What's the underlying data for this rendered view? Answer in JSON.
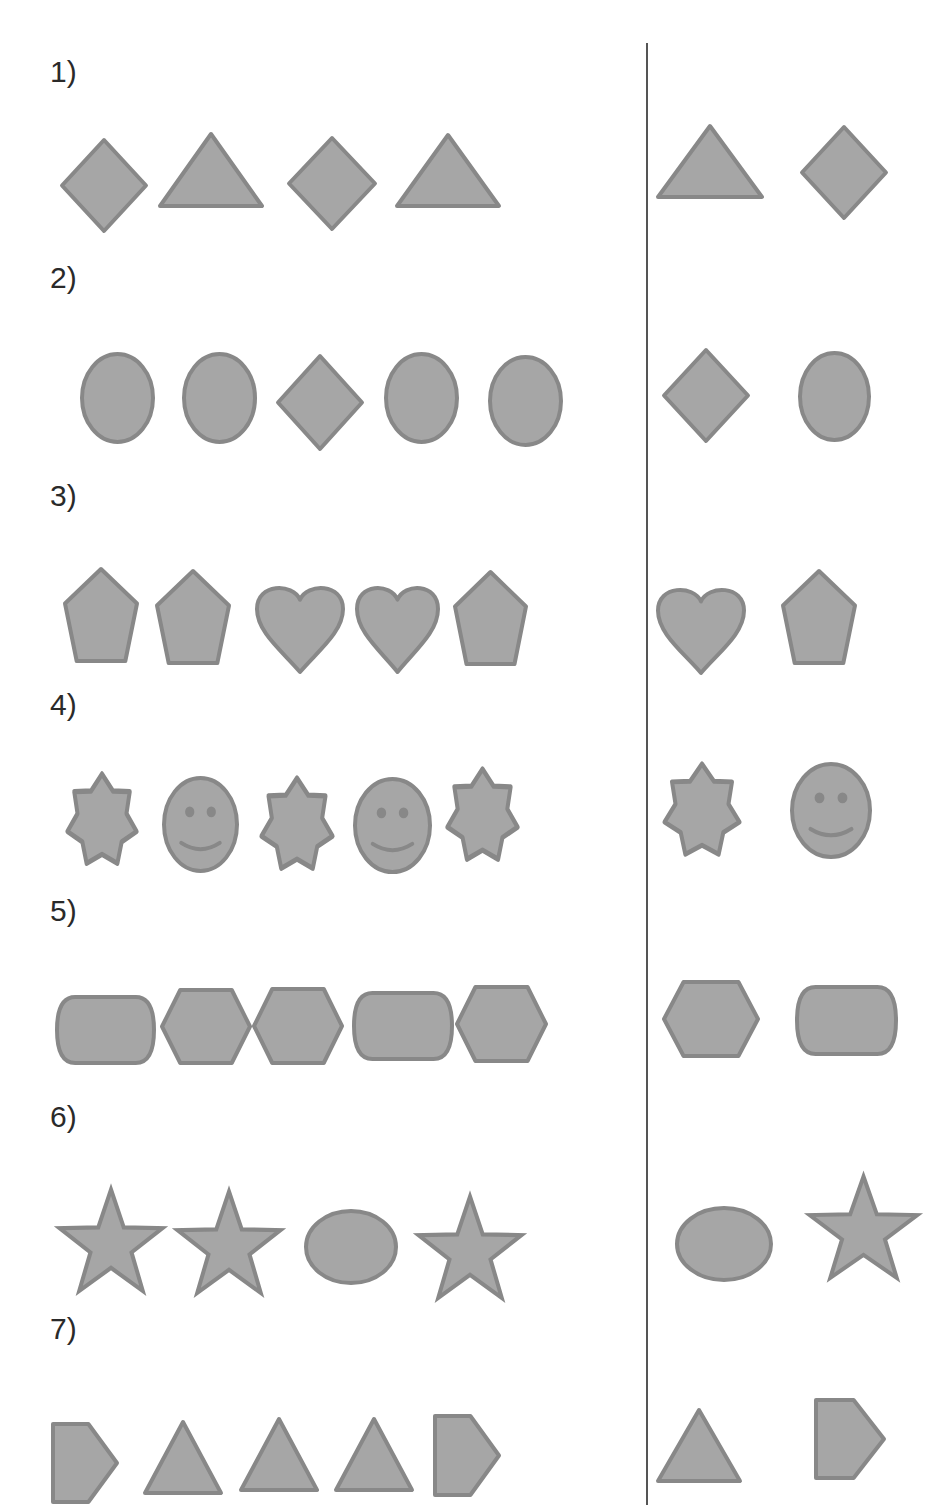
{
  "worksheet": {
    "colors": {
      "fill": "#a6a6a6",
      "stroke": "#888888",
      "text": "#2a2a2a",
      "divider": "#555555"
    },
    "problems": [
      {
        "label": "1)",
        "label_y": 57,
        "sequence": [
          {
            "shape": "diamond",
            "x": 60,
            "y": 138,
            "w": 88,
            "h": 95
          },
          {
            "shape": "triangle",
            "x": 158,
            "y": 132,
            "w": 106,
            "h": 76
          },
          {
            "shape": "diamond",
            "x": 287,
            "y": 136,
            "w": 90,
            "h": 95
          },
          {
            "shape": "triangle",
            "x": 395,
            "y": 133,
            "w": 106,
            "h": 75
          }
        ],
        "answer_choices": [
          {
            "shape": "triangle",
            "x": 656,
            "y": 124,
            "w": 108,
            "h": 75
          },
          {
            "shape": "diamond",
            "x": 800,
            "y": 125,
            "w": 88,
            "h": 95
          }
        ]
      },
      {
        "label": "2)",
        "label_y": 263,
        "sequence": [
          {
            "shape": "ellipse",
            "x": 80,
            "y": 352,
            "w": 75,
            "h": 92
          },
          {
            "shape": "ellipse",
            "x": 182,
            "y": 352,
            "w": 75,
            "h": 92
          },
          {
            "shape": "diamond",
            "x": 276,
            "y": 354,
            "w": 88,
            "h": 97
          },
          {
            "shape": "ellipse",
            "x": 384,
            "y": 352,
            "w": 75,
            "h": 92
          },
          {
            "shape": "ellipse",
            "x": 488,
            "y": 355,
            "w": 75,
            "h": 92
          }
        ],
        "answer_choices": [
          {
            "shape": "diamond",
            "x": 662,
            "y": 348,
            "w": 88,
            "h": 95
          },
          {
            "shape": "ellipse",
            "x": 798,
            "y": 351,
            "w": 73,
            "h": 91
          }
        ]
      },
      {
        "label": "3)",
        "label_y": 481,
        "sequence": [
          {
            "shape": "pentagon",
            "x": 63,
            "y": 567,
            "w": 76,
            "h": 96
          },
          {
            "shape": "pentagon",
            "x": 155,
            "y": 569,
            "w": 76,
            "h": 96
          },
          {
            "shape": "heart",
            "x": 255,
            "y": 581,
            "w": 90,
            "h": 93
          },
          {
            "shape": "heart",
            "x": 355,
            "y": 581,
            "w": 85,
            "h": 93
          },
          {
            "shape": "pentagon",
            "x": 453,
            "y": 570,
            "w": 75,
            "h": 96
          }
        ],
        "answer_choices": [
          {
            "shape": "heart",
            "x": 656,
            "y": 583,
            "w": 90,
            "h": 92
          },
          {
            "shape": "pentagon",
            "x": 781,
            "y": 569,
            "w": 76,
            "h": 96
          }
        ]
      },
      {
        "label": "4)",
        "label_y": 690,
        "sequence": [
          {
            "shape": "star7",
            "x": 65,
            "y": 770,
            "w": 74,
            "h": 102
          },
          {
            "shape": "smiley",
            "x": 162,
            "y": 776,
            "w": 77,
            "h": 97
          },
          {
            "shape": "star7",
            "x": 259,
            "y": 774,
            "w": 76,
            "h": 103
          },
          {
            "shape": "smiley",
            "x": 353,
            "y": 777,
            "w": 79,
            "h": 97
          },
          {
            "shape": "star7",
            "x": 445,
            "y": 765,
            "w": 75,
            "h": 103
          }
        ],
        "answer_choices": [
          {
            "shape": "star7",
            "x": 662,
            "y": 760,
            "w": 80,
            "h": 103
          },
          {
            "shape": "smiley",
            "x": 790,
            "y": 762,
            "w": 82,
            "h": 97
          }
        ]
      },
      {
        "label": "5)",
        "label_y": 896,
        "sequence": [
          {
            "shape": "rounded-rect",
            "x": 55,
            "y": 995,
            "w": 101,
            "h": 70
          },
          {
            "shape": "hexagon",
            "x": 160,
            "y": 988,
            "w": 92,
            "h": 77
          },
          {
            "shape": "hexagon",
            "x": 252,
            "y": 987,
            "w": 92,
            "h": 78
          },
          {
            "shape": "rounded-rect",
            "x": 352,
            "y": 991,
            "w": 102,
            "h": 70
          },
          {
            "shape": "hexagon",
            "x": 455,
            "y": 985,
            "w": 93,
            "h": 78
          }
        ],
        "answer_choices": [
          {
            "shape": "hexagon",
            "x": 662,
            "y": 980,
            "w": 98,
            "h": 78
          },
          {
            "shape": "rounded-rect",
            "x": 795,
            "y": 985,
            "w": 103,
            "h": 71
          }
        ]
      },
      {
        "label": "6)",
        "label_y": 1102,
        "sequence": [
          {
            "shape": "star5",
            "x": 57,
            "y": 1185,
            "w": 108,
            "h": 112
          },
          {
            "shape": "star5",
            "x": 175,
            "y": 1187,
            "w": 108,
            "h": 112
          },
          {
            "shape": "ellipse-wide",
            "x": 304,
            "y": 1209,
            "w": 94,
            "h": 76
          },
          {
            "shape": "star5",
            "x": 416,
            "y": 1192,
            "w": 108,
            "h": 112
          }
        ],
        "answer_choices": [
          {
            "shape": "ellipse-wide",
            "x": 675,
            "y": 1206,
            "w": 98,
            "h": 76
          },
          {
            "shape": "star5",
            "x": 807,
            "y": 1172,
            "w": 113,
            "h": 112
          }
        ]
      },
      {
        "label": "7)",
        "label_y": 1314,
        "sequence": [
          {
            "shape": "pentagon-arrow",
            "x": 51,
            "y": 1422,
            "w": 68,
            "h": 82
          },
          {
            "shape": "triangle-tall",
            "x": 143,
            "y": 1420,
            "w": 80,
            "h": 75
          },
          {
            "shape": "triangle-tall",
            "x": 239,
            "y": 1417,
            "w": 80,
            "h": 75
          },
          {
            "shape": "triangle-tall",
            "x": 334,
            "y": 1417,
            "w": 80,
            "h": 75
          },
          {
            "shape": "pentagon-arrow",
            "x": 433,
            "y": 1414,
            "w": 68,
            "h": 83
          }
        ],
        "answer_choices": [
          {
            "shape": "triangle-tall",
            "x": 656,
            "y": 1408,
            "w": 86,
            "h": 75
          },
          {
            "shape": "pentagon-arrow",
            "x": 814,
            "y": 1398,
            "w": 72,
            "h": 82
          }
        ]
      }
    ]
  }
}
